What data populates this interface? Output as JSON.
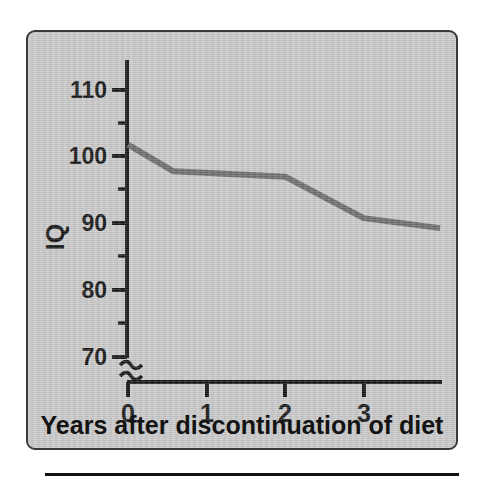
{
  "figure": {
    "panel_background": "#c9c9c9",
    "border_color": "#3a3a3a",
    "line_color": "#6d6d6d",
    "axis_color": "#171717"
  },
  "chart_data": {
    "type": "line",
    "title": "",
    "xlabel": "Years after discontinuation of diet",
    "ylabel": "IQ",
    "xlim": [
      0,
      4
    ],
    "ylim": [
      70,
      113
    ],
    "grid": false,
    "legend": null,
    "axis_break": {
      "axis": "y",
      "symbol": "squiggle",
      "below_value": 70,
      "note": "y-axis broken between baseline and 70"
    },
    "x_ticks": [
      0,
      1,
      2,
      3
    ],
    "x_tick_labels": [
      "0",
      "1",
      "2",
      "3"
    ],
    "y_ticks": [
      70,
      80,
      90,
      100,
      110
    ],
    "y_tick_labels": [
      "70",
      "80",
      "90",
      "100",
      "110"
    ],
    "y_minor_ticks": [
      75,
      85,
      95,
      105
    ],
    "series": [
      {
        "name": "IQ after discontinuation of diet",
        "color": "#6d6d6d",
        "x": [
          0,
          0.58,
          2.0,
          3.0,
          3.97
        ],
        "values": [
          101.7,
          97.7,
          96.9,
          90.7,
          89.2
        ]
      }
    ]
  },
  "axis_labels": {
    "y_title": "IQ",
    "x_title": "Years after discontinuation of diet",
    "y": {
      "t110": "110",
      "t100": "100",
      "t90": "90",
      "t80": "80",
      "t70": "70"
    },
    "x": {
      "t0": "0",
      "t1": "1",
      "t2": "2",
      "t3": "3"
    }
  }
}
